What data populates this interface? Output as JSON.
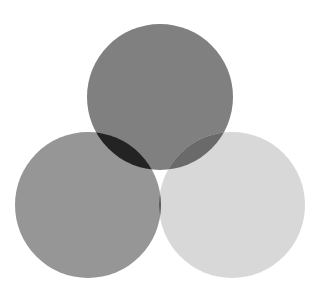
{
  "figure": {
    "width": 320,
    "height": 295,
    "background_color": "#ffffff"
  },
  "chart_data": {
    "type": "venn",
    "title": "",
    "subtitle": "",
    "xlabel": "",
    "ylabel": "",
    "grid": false,
    "legend_position": "none",
    "set_count": 3,
    "canvas": {
      "width": 320,
      "height": 295,
      "background": "#ffffff"
    },
    "sets": [
      {
        "id": "top",
        "label": "",
        "cx": 160,
        "cy": 97,
        "r": 73,
        "fill": "#808080",
        "opacity": 1
      },
      {
        "id": "left",
        "label": "",
        "cx": 88,
        "cy": 205,
        "r": 73,
        "fill": "#969696",
        "opacity": 1
      },
      {
        "id": "right",
        "label": "",
        "cx": 232,
        "cy": 205,
        "r": 73,
        "fill": "#d8d8d8",
        "opacity": 1
      }
    ],
    "regions": [
      {
        "id": "top-only",
        "members": [
          "top"
        ],
        "fill": "#808080"
      },
      {
        "id": "left-only",
        "members": [
          "left"
        ],
        "fill": "#969696"
      },
      {
        "id": "right-only",
        "members": [
          "right"
        ],
        "fill": "#d8d8d8"
      },
      {
        "id": "top-left",
        "members": [
          "top",
          "left"
        ],
        "fill": "#232323"
      },
      {
        "id": "top-right",
        "members": [
          "top",
          "right"
        ],
        "fill": "#6a6a6a"
      },
      {
        "id": "left-right",
        "members": [
          "left",
          "right"
        ],
        "fill": "#585858"
      },
      {
        "id": "top-left-right",
        "members": [
          "top",
          "left",
          "right"
        ],
        "fill": "#050505"
      }
    ],
    "palette": {
      "lightest": "#d8d8d8",
      "light": "#969696",
      "mid": "#808080",
      "mid_dark": "#6a6a6a",
      "dark": "#585858",
      "darker": "#232323",
      "darkest": "#050505"
    }
  }
}
